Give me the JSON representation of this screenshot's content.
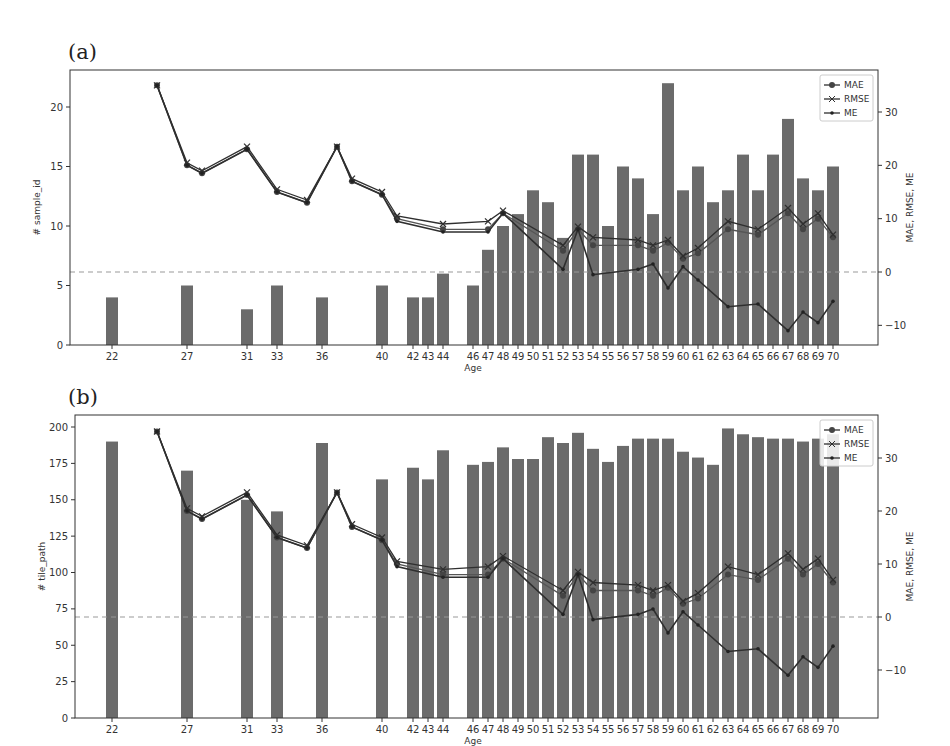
{
  "panels": [
    {
      "label": "(a)",
      "ylabel_left": "# sample_id",
      "ylabel_right": "MAE, RMSE, ME",
      "xlabel": "Age"
    },
    {
      "label": "(b)",
      "ylabel_left": "# tile_path",
      "ylabel_right": "MAE, RMSE, ME",
      "xlabel": "Age"
    }
  ],
  "legend": [
    "MAE",
    "RMSE",
    "ME"
  ],
  "colors": {
    "bar": "#6b6b6b",
    "line": "#2f2f2f",
    "zero_line": "#999999"
  },
  "chart_data": [
    {
      "type": "bar",
      "title": "(a)",
      "xlabel": "Age",
      "ylabel": "# sample_id",
      "ylabel_right": "MAE, RMSE, ME",
      "ylim": [
        0,
        23
      ],
      "ylim_right": [
        -13,
        38
      ],
      "yticks": [
        0,
        5,
        10,
        15,
        20
      ],
      "yticks_right": [
        -10,
        0,
        10,
        20,
        30
      ],
      "grid": false,
      "legend_position": "upper right",
      "categories": [
        22,
        27,
        31,
        33,
        36,
        40,
        42,
        43,
        44,
        46,
        47,
        48,
        49,
        50,
        51,
        52,
        53,
        54,
        55,
        56,
        57,
        58,
        59,
        60,
        61,
        62,
        63,
        64,
        65,
        66,
        67,
        68,
        69,
        70
      ],
      "values": [
        4,
        5,
        3,
        5,
        4,
        5,
        4,
        4,
        6,
        5,
        8,
        10,
        11,
        13,
        12,
        9,
        16,
        16,
        10,
        15,
        14,
        11,
        22,
        13,
        15,
        12,
        13,
        16,
        13,
        16,
        19,
        14,
        13,
        15
      ],
      "lines": {
        "x": [
          25,
          27,
          28,
          31,
          33,
          35,
          37,
          38,
          40,
          41,
          44,
          47,
          48,
          52,
          53,
          54,
          57,
          58,
          59,
          60,
          61,
          63,
          65,
          67,
          68,
          69,
          70
        ],
        "series": [
          {
            "name": "MAE",
            "values": [
              35,
              20,
              18.5,
              23,
              15,
              13,
              23.5,
              17,
              14.5,
              10,
              8,
              8,
              11,
              4,
              8,
              5,
              5,
              4,
              5.5,
              2.5,
              3.5,
              8,
              7,
              11,
              8,
              10,
              6.5
            ]
          },
          {
            "name": "RMSE",
            "values": [
              35,
              20.5,
              19,
              23.5,
              15.5,
              13.5,
              23.5,
              17.5,
              15,
              10.5,
              9,
              9.5,
              11.5,
              5,
              8.5,
              6.5,
              6,
              5,
              6,
              3,
              4.5,
              9.5,
              8,
              12,
              9,
              11,
              7
            ]
          },
          {
            "name": "ME",
            "values": [
              35,
              20,
              18.5,
              23,
              15,
              13,
              23.5,
              17,
              14.5,
              9.5,
              7.5,
              7.5,
              11,
              0.5,
              8,
              -0.5,
              0.5,
              1.5,
              -3,
              1,
              -1.5,
              -6.5,
              -6,
              -11,
              -7.5,
              -9.5,
              -5.5
            ]
          }
        ]
      }
    },
    {
      "type": "bar",
      "title": "(b)",
      "xlabel": "Age",
      "ylabel": "# tile_path",
      "ylabel_right": "MAE, RMSE, ME",
      "ylim": [
        0,
        210
      ],
      "ylim_right": [
        -13,
        38
      ],
      "yticks": [
        0,
        25,
        50,
        75,
        100,
        125,
        150,
        175,
        200
      ],
      "yticks_right": [
        -10,
        0,
        10,
        20,
        30
      ],
      "grid": false,
      "legend_position": "upper right",
      "categories": [
        22,
        27,
        31,
        33,
        36,
        40,
        42,
        43,
        44,
        46,
        47,
        48,
        49,
        50,
        51,
        52,
        53,
        54,
        55,
        56,
        57,
        58,
        59,
        60,
        61,
        62,
        63,
        64,
        65,
        66,
        67,
        68,
        69,
        70
      ],
      "values": [
        190,
        170,
        150,
        142,
        189,
        164,
        172,
        164,
        184,
        174,
        176,
        186,
        178,
        178,
        193,
        189,
        196,
        185,
        176,
        187,
        192,
        192,
        192,
        183,
        179,
        174,
        199,
        195,
        193,
        192,
        192,
        190,
        192,
        195
      ],
      "lines": {
        "x": [
          25,
          27,
          28,
          31,
          33,
          35,
          37,
          38,
          40,
          41,
          44,
          47,
          48,
          52,
          53,
          54,
          57,
          58,
          59,
          60,
          61,
          63,
          65,
          67,
          68,
          69,
          70
        ],
        "series": [
          {
            "name": "MAE",
            "values": [
              35,
              20,
              18.5,
              23,
              15,
              13,
              23.5,
              17,
              14.5,
              10,
              8,
              8,
              11,
              4,
              8,
              5,
              5,
              4,
              5.5,
              2.5,
              3.5,
              8,
              7,
              11,
              8,
              10,
              6.5
            ]
          },
          {
            "name": "RMSE",
            "values": [
              35,
              20.5,
              19,
              23.5,
              15.5,
              13.5,
              23.5,
              17.5,
              15,
              10.5,
              9,
              9.5,
              11.5,
              5,
              8.5,
              6.5,
              6,
              5,
              6,
              3,
              4.5,
              9.5,
              8,
              12,
              9,
              11,
              7
            ]
          },
          {
            "name": "ME",
            "values": [
              35,
              20,
              18.5,
              23,
              15,
              13,
              23.5,
              17,
              14.5,
              9.5,
              7.5,
              7.5,
              11,
              0.5,
              8,
              -0.5,
              0.5,
              1.5,
              -3,
              1,
              -1.5,
              -6.5,
              -6,
              -11,
              -7.5,
              -9.5,
              -5.5
            ]
          }
        ]
      }
    }
  ]
}
